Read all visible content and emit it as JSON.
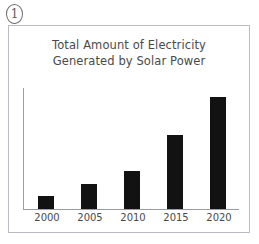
{
  "marker": {
    "label": "1",
    "shape": "circled-number"
  },
  "figure": {
    "title_line1": "Total Amount of Electricity",
    "title_line2": "Generated by Solar Power",
    "border_color": "#b9bcc2",
    "background": "#ffffff"
  },
  "chart_data": {
    "type": "bar",
    "title": "Total Amount of Electricity Generated by Solar Power",
    "categories": [
      "2000",
      "2005",
      "2010",
      "2015",
      "2020"
    ],
    "values": [
      12,
      22,
      34,
      66,
      100
    ],
    "xlabel": "",
    "ylabel": "",
    "ylim": [
      0,
      108
    ],
    "grid": false,
    "legend": null,
    "bar_color": "#121212",
    "axis_color": "#9a9da3",
    "tick_label_color": "#4a4a4a"
  }
}
